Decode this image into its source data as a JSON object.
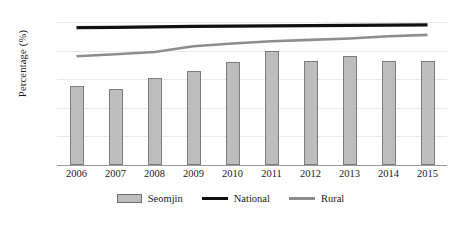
{
  "chart_data": {
    "type": "bar",
    "title": "",
    "xlabel": "",
    "ylabel": "Percentage (%)",
    "categories": [
      "2006",
      "2007",
      "2008",
      "2009",
      "2010",
      "2011",
      "2012",
      "2013",
      "2014",
      "2015"
    ],
    "ylim": [
      0,
      100
    ],
    "yticks": [
      0,
      20,
      40,
      60,
      80,
      100
    ],
    "grid": true,
    "legend_position": "bottom-center",
    "series": [
      {
        "name": "Seomjin",
        "render": "bar",
        "color": "#bdbdbd",
        "edge_color": "#7c7c7c",
        "values": [
          55,
          53,
          61,
          66,
          72,
          80,
          73,
          76,
          73,
          73
        ]
      },
      {
        "name": "National",
        "render": "line",
        "color": "#111111",
        "values": [
          96,
          96.3,
          96.6,
          96.9,
          97.1,
          97.3,
          97.5,
          97.6,
          97.8,
          98
        ]
      },
      {
        "name": "Rural",
        "render": "line",
        "color": "#8d8d8d",
        "values": [
          76,
          77.5,
          79,
          83,
          85,
          86.5,
          87.5,
          88.5,
          90,
          91
        ]
      }
    ]
  },
  "legend": {
    "items": [
      {
        "label": "Seomjin",
        "marker": "bar-swatch"
      },
      {
        "label": "National",
        "marker": "line-swatch-black"
      },
      {
        "label": "Rural",
        "marker": "line-swatch-gray"
      }
    ]
  }
}
